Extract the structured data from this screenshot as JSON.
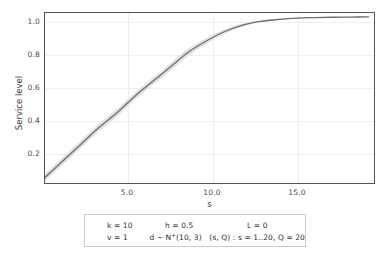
{
  "chart_data": {
    "type": "line",
    "title": "",
    "subtitle": "",
    "xlabel": "s",
    "ylabel": "Service level",
    "xlim": [
      1,
      19.3
    ],
    "ylim": [
      0.1,
      1.02
    ],
    "xticks": [
      "5.0",
      "10.0",
      "15.0"
    ],
    "xtick_values": [
      5.0,
      10.0,
      15.0
    ],
    "yticks": [
      "0.2",
      "0.4",
      "0.6",
      "0.8",
      "1.0"
    ],
    "ytick_values": [
      0.2,
      0.4,
      0.6,
      0.8,
      1.0
    ],
    "grid": true,
    "legend_position": "none",
    "band_label": "confidence band",
    "series": [
      {
        "name": "Service level",
        "color": "#6e6e6e",
        "x": [
          1,
          2,
          3,
          4,
          5,
          6,
          7,
          8,
          9,
          10,
          11,
          12,
          13,
          14,
          15,
          16,
          17,
          18,
          19
        ],
        "values": [
          0.13,
          0.22,
          0.31,
          0.4,
          0.48,
          0.57,
          0.65,
          0.73,
          0.81,
          0.87,
          0.92,
          0.955,
          0.975,
          0.985,
          0.992,
          0.995,
          0.997,
          0.998,
          0.999
        ],
        "band_lower": [
          0.11,
          0.2,
          0.29,
          0.38,
          0.46,
          0.55,
          0.63,
          0.71,
          0.79,
          0.855,
          0.908,
          0.947,
          0.97,
          0.982,
          0.99,
          0.994,
          0.996,
          0.997,
          0.998
        ],
        "band_upper": [
          0.15,
          0.24,
          0.33,
          0.42,
          0.5,
          0.59,
          0.67,
          0.75,
          0.83,
          0.885,
          0.932,
          0.963,
          0.98,
          0.988,
          0.994,
          0.996,
          0.998,
          0.999,
          1.0
        ],
        "band_color": "#dcdcdc"
      }
    ]
  },
  "axes": {
    "ylabel": "Service level",
    "xlabel": "s",
    "ytick_labels": [
      "1.0",
      "0.8",
      "0.6",
      "0.4",
      "0.2"
    ],
    "xtick_labels": [
      "5.0",
      "10.0",
      "15.0"
    ]
  },
  "param_box": {
    "rows": [
      {
        "c1": "k = 10",
        "c2": "h = 0.5",
        "c3": "L = 0"
      },
      {
        "c1": "v = 1",
        "c2_pre": "d ~ N",
        "c2_sup": "+",
        "c2_post": "(10, 3)",
        "c3": "(s, Q) : s = 1..20, Q = 20"
      }
    ]
  },
  "colors": {
    "line": "#6e6e6e",
    "band": "#dcdcdc",
    "frame": "#555555",
    "grid": "#f0eef2",
    "text": "#3a3a3a",
    "box_border": "#c9c9c9"
  }
}
